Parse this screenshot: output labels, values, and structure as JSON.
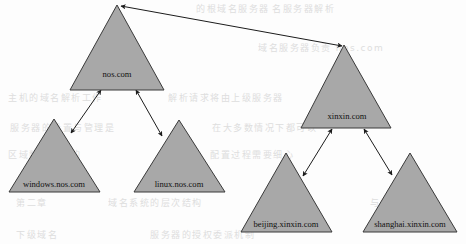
{
  "diagram": {
    "type": "tree",
    "node_shape": "triangle",
    "colors": {
      "node_fill": "#a8a8a8",
      "node_stroke": "#3a3a3a",
      "edge_stroke": "#1c1c1c",
      "label_text": "#111111",
      "background": "#fdfdfd",
      "bleed_text": "#d9d9d9"
    },
    "nodes": [
      {
        "id": "nos",
        "label": "nos.com",
        "level": 0,
        "apex": [
          117,
          5
        ],
        "base_left": [
          70,
          90
        ],
        "base_right": [
          164,
          90
        ],
        "label_pos": [
          117,
          77
        ],
        "font_size": 8.6
      },
      {
        "id": "xinxin",
        "label": "xinxin.com",
        "level": 0,
        "apex": [
          344,
          45
        ],
        "base_left": [
          301,
          128
        ],
        "base_right": [
          391,
          128
        ],
        "label_pos": [
          347,
          119
        ],
        "font_size": 8.6
      },
      {
        "id": "windows-nos",
        "label": "windows.nos.com",
        "level": 1,
        "apex": [
          54,
          119
        ],
        "base_left": [
          9,
          192
        ],
        "base_right": [
          100,
          192
        ],
        "label_pos": [
          54,
          187
        ],
        "font_size": 8.6
      },
      {
        "id": "linux-nos",
        "label": "linux.nos.com",
        "level": 1,
        "apex": [
          179,
          120
        ],
        "base_left": [
          134,
          192
        ],
        "base_right": [
          225,
          192
        ],
        "label_pos": [
          179,
          187
        ],
        "font_size": 8.6
      },
      {
        "id": "beijing-xinxin",
        "label": "beijing.xinxin.com",
        "level": 1,
        "apex": [
          286,
          153
        ],
        "base_left": [
          241,
          232
        ],
        "base_right": [
          332,
          232
        ],
        "label_pos": [
          286,
          227
        ],
        "font_size": 8.6
      },
      {
        "id": "shanghai-xinxin",
        "label": "shanghai.xinxin.com",
        "level": 1,
        "apex": [
          410,
          153
        ],
        "base_left": [
          363,
          232
        ],
        "base_right": [
          457,
          232
        ],
        "label_pos": [
          410,
          227
        ],
        "font_size": 8.6
      }
    ],
    "edges": [
      {
        "id": "edge-nos-xinxin",
        "from": "nos",
        "to": "xinxin",
        "from_point": [
          121,
          6
        ],
        "to_point": [
          342,
          46
        ],
        "arrow": "double"
      },
      {
        "id": "edge-nos-windows",
        "from": "nos",
        "to": "windows-nos",
        "from_point": [
          101,
          90
        ],
        "to_point": [
          71,
          133
        ],
        "arrow": "double"
      },
      {
        "id": "edge-nos-linux",
        "from": "nos",
        "to": "linux-nos",
        "from_point": [
          136,
          90
        ],
        "to_point": [
          162,
          136
        ],
        "arrow": "double"
      },
      {
        "id": "edge-xinxin-beijing",
        "from": "xinxin",
        "to": "beijing-xinxin",
        "from_point": [
          332,
          129
        ],
        "to_point": [
          303,
          176
        ],
        "arrow": "double"
      },
      {
        "id": "edge-xinxin-shanghai",
        "from": "xinxin",
        "to": "shanghai-xinxin",
        "from_point": [
          364,
          129
        ],
        "to_point": [
          392,
          175
        ],
        "arrow": "double"
      }
    ],
    "background_bleed": [
      {
        "id": "bleed-1",
        "text": "的根域名服务器",
        "pos": [
          196,
          12
        ],
        "size": 9,
        "spacing": 1.5
      },
      {
        "id": "bleed-2",
        "text": "名服务器解析",
        "pos": [
          272,
          12
        ],
        "size": 9,
        "spacing": 1.5
      },
      {
        "id": "bleed-3",
        "text": "域名服务器负责 nos.com",
        "pos": [
          258,
          51
        ],
        "size": 9,
        "spacing": 1.5
      },
      {
        "id": "bleed-4",
        "text": "主机的域名解析工作",
        "pos": [
          8,
          101
        ],
        "size": 9,
        "spacing": 1.5
      },
      {
        "id": "bleed-5",
        "text": "解析请求将由上级服务器",
        "pos": [
          168,
          101
        ],
        "size": 9,
        "spacing": 1.5
      },
      {
        "id": "bleed-6",
        "text": "服务器的设置与管理是",
        "pos": [
          10,
          131
        ],
        "size": 9,
        "spacing": 1.5
      },
      {
        "id": "bleed-7",
        "text": "在大多数情况下都可以",
        "pos": [
          212,
          131
        ],
        "size": 9,
        "spacing": 1.5
      },
      {
        "id": "bleed-8",
        "text": "区域数据文件的",
        "pos": [
          8,
          158
        ],
        "size": 9,
        "spacing": 1.5
      },
      {
        "id": "bleed-9",
        "text": "配置过程需要细心",
        "pos": [
          210,
          158
        ],
        "size": 9,
        "spacing": 1.5
      },
      {
        "id": "bleed-10",
        "text": "第二章",
        "pos": [
          16,
          206
        ],
        "size": 9,
        "spacing": 1.5
      },
      {
        "id": "bleed-11",
        "text": "域名系统的层次结构",
        "pos": [
          108,
          206
        ],
        "size": 9,
        "spacing": 1.5
      },
      {
        "id": "bleed-12",
        "text": "与解析原理",
        "pos": [
          370,
          206
        ],
        "size": 9,
        "spacing": 1.5
      },
      {
        "id": "bleed-13",
        "text": "下级域名",
        "pos": [
          16,
          238
        ],
        "size": 9,
        "spacing": 1.5
      },
      {
        "id": "bleed-14",
        "text": "服务器的授权委派机制",
        "pos": [
          150,
          238
        ],
        "size": 9,
        "spacing": 1.5
      }
    ]
  }
}
